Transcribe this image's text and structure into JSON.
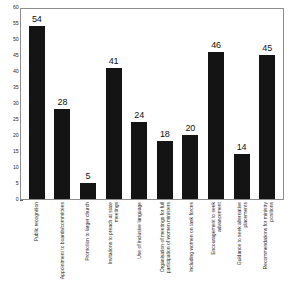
{
  "chart_data": {
    "type": "bar",
    "title": "",
    "subtitle": "",
    "xlabel": "",
    "ylabel": "",
    "ylim": [
      0,
      60
    ],
    "ytick_step": 5,
    "yticks": [
      0,
      5,
      10,
      15,
      20,
      25,
      30,
      35,
      40,
      45,
      50,
      55,
      60
    ],
    "ytick_labels": [
      "0",
      "5",
      "10",
      "15",
      "20",
      "25",
      "30",
      "35",
      "40",
      "45",
      "50",
      "55",
      "60"
    ],
    "grid": false,
    "legend": "none",
    "bar_color": "#141414",
    "frame_color": "#8d8d8d",
    "background": "#ffffff",
    "show_data_labels": true,
    "categories": [
      "Public recognition",
      "Appointment to boards/committees",
      "Promotion to larger church",
      "Invitations to preach at state meetings",
      "Use of inclusive language",
      "Organisation of meetings for full participation of women ministers",
      "Including women on task forces",
      "Encouragement to seek advancement",
      "Guidance to seek alternative placements",
      "Recommendations for ministry positions"
    ],
    "values": [
      54,
      28,
      5,
      41,
      24,
      18,
      20,
      46,
      14,
      45
    ]
  }
}
